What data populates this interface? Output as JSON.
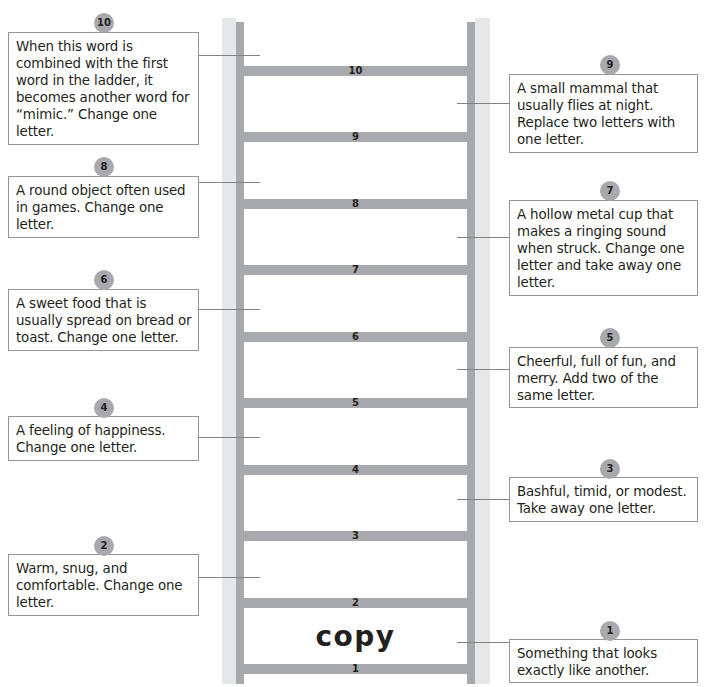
{
  "ladder": {
    "start_word": "copy",
    "rungs": [
      "10",
      "9",
      "8",
      "7",
      "6",
      "5",
      "4",
      "3",
      "2",
      "1"
    ]
  },
  "clues": [
    {
      "number": "1",
      "text": "Something that looks exactly like another."
    },
    {
      "number": "2",
      "text": "Warm, snug, and comfortable.  Change one letter."
    },
    {
      "number": "3",
      "text": "Bashful, timid, or modest. Take away one letter."
    },
    {
      "number": "4",
      "text": "A feeling of happiness. Change one letter."
    },
    {
      "number": "5",
      "text": "Cheerful, full of fun, and merry.  Add two of the same letter."
    },
    {
      "number": "6",
      "text": "A sweet food that is usually spread on bread or toast.  Change one letter."
    },
    {
      "number": "7",
      "text": "A hollow metal cup that makes a ringing sound when struck.  Change one letter and take away one letter."
    },
    {
      "number": "8",
      "text": "A round object often used in games.  Change one letter."
    },
    {
      "number": "9",
      "text": "A small mammal that usually flies at night. Replace two letters with one letter."
    },
    {
      "number": "10",
      "text": "When this word is combined with the first word in the ladder, it becomes another word for “mimic.”  Change one letter."
    }
  ],
  "colors": {
    "rail_light": "#e6e7e8",
    "rail_dark": "#a7a9ac",
    "badge": "#a7a9ac",
    "box_border": "#939598",
    "text": "#231f20"
  }
}
